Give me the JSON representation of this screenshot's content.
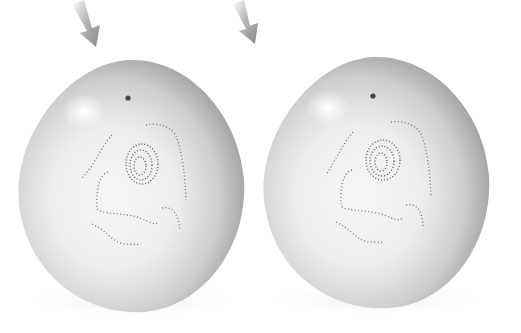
{
  "figure": {
    "colors": {
      "background": "#ffffff",
      "cell_light": "#f4f4f4",
      "cell_mid": "#c8c8c8",
      "cell_dark": "#8a8a8a",
      "arrow": "#8c8c8c",
      "dots": "#6a6a6a"
    },
    "cells": [
      {
        "id": "left",
        "label": "cell-1"
      },
      {
        "id": "right",
        "label": "cell-2"
      }
    ],
    "arrows": [
      {
        "id": "arrow-1",
        "icon": "arrow-down-right-icon"
      },
      {
        "id": "arrow-2",
        "icon": "arrow-down-right-icon"
      }
    ]
  }
}
